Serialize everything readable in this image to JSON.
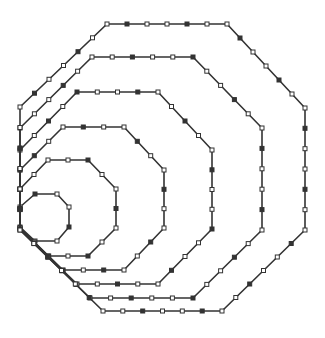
{
  "figure": {
    "stroke_color": "#333333",
    "background": "#ffffff",
    "octagons": [
      {
        "name": "octagon-1",
        "points": [
          [
            35,
            194
          ],
          [
            57,
            194
          ],
          [
            69,
            207
          ],
          [
            69,
            227
          ],
          [
            57,
            241
          ],
          [
            35,
            241
          ],
          [
            20,
            227
          ],
          [
            20,
            207
          ]
        ]
      },
      {
        "name": "octagon-2",
        "points": [
          [
            48,
            160
          ],
          [
            88,
            160
          ],
          [
            116,
            189
          ],
          [
            116,
            228
          ],
          [
            88,
            256
          ],
          [
            48,
            256
          ],
          [
            20,
            228
          ],
          [
            20,
            189
          ]
        ]
      },
      {
        "name": "octagon-3",
        "points": [
          [
            63,
            127
          ],
          [
            124,
            127
          ],
          [
            164,
            170
          ],
          [
            164,
            228
          ],
          [
            124,
            270
          ],
          [
            63,
            270
          ],
          [
            20,
            228
          ],
          [
            20,
            170
          ]
        ]
      },
      {
        "name": "octagon-4",
        "points": [
          [
            77,
            92
          ],
          [
            158,
            92
          ],
          [
            212,
            150
          ],
          [
            212,
            229
          ],
          [
            158,
            284
          ],
          [
            77,
            284
          ],
          [
            20,
            229
          ],
          [
            20,
            150
          ]
        ]
      },
      {
        "name": "octagon-5",
        "points": [
          [
            92,
            57
          ],
          [
            193,
            57
          ],
          [
            262,
            128
          ],
          [
            262,
            230
          ],
          [
            193,
            298
          ],
          [
            90,
            298
          ],
          [
            20,
            230
          ],
          [
            20,
            128
          ]
        ]
      },
      {
        "name": "octagon-6",
        "points": [
          [
            107,
            24
          ],
          [
            227,
            24
          ],
          [
            305,
            108
          ],
          [
            305,
            230
          ],
          [
            222,
            311
          ],
          [
            103,
            311
          ],
          [
            20,
            230
          ],
          [
            20,
            107
          ]
        ]
      }
    ]
  }
}
